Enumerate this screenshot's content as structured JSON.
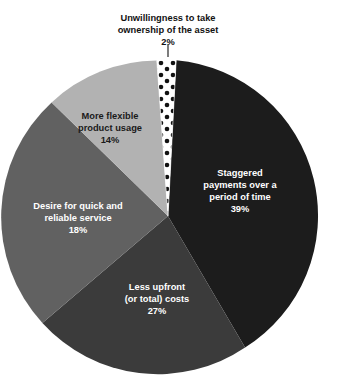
{
  "chart_data": {
    "type": "pie",
    "title": "",
    "subtitle": "",
    "xlabel": "",
    "ylabel": "",
    "legend_position": "none",
    "grid": false,
    "labels_inside_slices": true,
    "start_angle_deg": -3,
    "direction": "clockwise",
    "categories": [
      "Staggered payments over a period of time",
      "Less upfront (or total) costs",
      "Desire for quick and reliable service",
      "More flexible product usage",
      "Unwillingness to take ownership of the asset"
    ],
    "values": [
      39,
      27,
      18,
      14,
      2
    ],
    "unit": "%",
    "slices": [
      {
        "label_line1": "Staggered",
        "label_line2": "payments over a",
        "label_line3": "period of time",
        "value_text": "39%",
        "value": 39,
        "color": "#1c1c1c",
        "fill_style": "solid",
        "text_color": "#ffffff",
        "label_x": 240,
        "label_y": 172
      },
      {
        "label_line1": "Less upfront",
        "label_line2": "(or total) costs",
        "label_line3": "",
        "value_text": "27%",
        "value": 27,
        "color": "#3b3b3b",
        "fill_style": "solid",
        "text_color": "#ffffff",
        "label_x": 157,
        "label_y": 289
      },
      {
        "label_line1": "Desire for quick and",
        "label_line2": "reliable service",
        "label_line3": "",
        "value_text": "18%",
        "value": 18,
        "color": "#616161",
        "fill_style": "solid",
        "text_color": "#ffffff",
        "label_x": 78,
        "label_y": 207
      },
      {
        "label_line1": "More flexible",
        "label_line2": "product usage",
        "label_line3": "",
        "value_text": "14%",
        "value": 14,
        "color": "#b2b2b2",
        "fill_style": "solid",
        "text_color": "#1a1a1a",
        "label_x": 110,
        "label_y": 117
      },
      {
        "label_line1": "Unwillingness to take",
        "label_line2": "ownership of the asset",
        "label_line3": "",
        "value_text": "2%",
        "value": 2,
        "color": "#ffffff",
        "fill_style": "polka-dot",
        "dot_color": "#111111",
        "text_color": "#111111",
        "label_x": 168,
        "label_y": 22,
        "callout": true
      }
    ],
    "geometry": {
      "center_x": 168,
      "center_y": 216,
      "radius": 156
    }
  }
}
